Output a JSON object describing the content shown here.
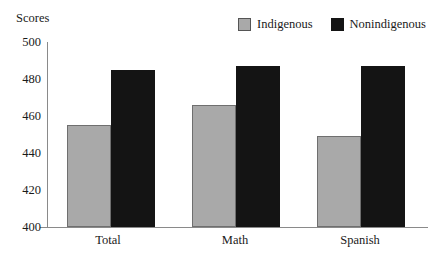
{
  "chart_data": {
    "type": "bar",
    "title": "",
    "xlabel": "",
    "ylabel": "Scores",
    "categories": [
      "Total",
      "Math",
      "Spanish"
    ],
    "ylim": [
      400,
      500
    ],
    "yticks": [
      400,
      420,
      440,
      460,
      480,
      500
    ],
    "grid": false,
    "legend_position": "top-right",
    "series": [
      {
        "name": "Indigenous",
        "color": "#a9a9a9",
        "values": [
          455,
          466,
          449
        ]
      },
      {
        "name": "Nonindigenous",
        "color": "#141414",
        "values": [
          485,
          487,
          487
        ]
      }
    ]
  },
  "axis": {
    "y_title": "Scores",
    "y_tick_labels": [
      "500",
      "480",
      "460",
      "440",
      "420",
      "400"
    ],
    "x_tick_labels": [
      "Total",
      "Math",
      "Spanish"
    ]
  },
  "legend": {
    "items": [
      {
        "label": "Indigenous",
        "swatch": "gray-swatch-icon"
      },
      {
        "label": "Nonindigenous",
        "swatch": "black-swatch-icon"
      }
    ]
  }
}
